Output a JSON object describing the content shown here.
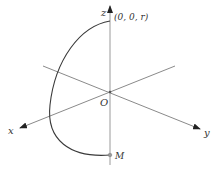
{
  "diagram": {
    "title": "",
    "axes": {
      "x_label": "x",
      "y_label": "y",
      "z_label": "z",
      "origin_label": "O"
    },
    "points": {
      "top_label": "(0, 0, r)",
      "bottom_label": "M"
    },
    "colors": {
      "axis": "#8a8a8a",
      "curve": "#3a3a3a",
      "text": "#333333"
    }
  }
}
